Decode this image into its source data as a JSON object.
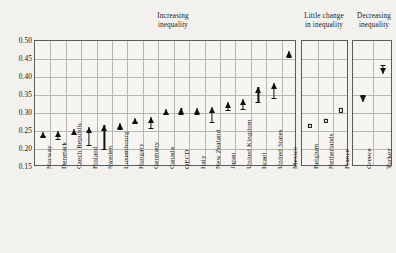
{
  "panels": {
    "increasing": {
      "title": "Increasing\ninequality"
    },
    "little": {
      "title": "Little change\nin inequality"
    },
    "decreasing": {
      "title": "Decreasing\ninequality"
    }
  },
  "axis": {
    "yticks": [
      "0.50",
      "0.45",
      "0.40",
      "0.35",
      "0.30",
      "0.25",
      "0.20",
      "0.15"
    ]
  },
  "chart_data": {
    "type": "scatter",
    "title": "Increasing inequality",
    "xlabel": "",
    "ylabel": "Gini coefficient",
    "ylim": [
      0.15,
      0.5
    ],
    "ytick_values": [
      0.5,
      0.45,
      0.4,
      0.35,
      0.3,
      0.25,
      0.2,
      0.15
    ],
    "grid": true,
    "legend": "none",
    "annotations": [
      "Increasing inequality",
      "Little change in inequality",
      "Decreasing inequality"
    ],
    "groups": [
      {
        "name": "Increasing inequality",
        "marker": "up-arrow",
        "categories": [
          "Norway",
          "Denmark",
          "Czech Republic",
          "Finland",
          "Sweden",
          "Luxembourg",
          "Hungary",
          "Germany",
          "Canada",
          "OECD",
          "Italy",
          "New Zealand",
          "Japan",
          "United Kingdom",
          "Israel",
          "United States",
          "Mexico"
        ],
        "series": [
          {
            "name": "start",
            "values": [
              0.235,
              0.228,
              0.242,
              0.212,
              0.199,
              0.256,
              0.275,
              0.258,
              0.296,
              0.298,
              0.298,
              0.275,
              0.308,
              0.31,
              0.33,
              0.343,
              0.455
            ]
          },
          {
            "name": "end",
            "values": [
              0.248,
              0.25,
              0.255,
              0.26,
              0.268,
              0.272,
              0.285,
              0.288,
              0.312,
              0.315,
              0.315,
              0.318,
              0.33,
              0.34,
              0.372,
              0.382,
              0.473
            ]
          }
        ]
      },
      {
        "name": "Little change in inequality",
        "marker": "open-square",
        "categories": [
          "Belgium",
          "Netherlands",
          "France"
        ],
        "series": [
          {
            "name": "value",
            "values": [
              0.265,
              0.277,
              0.307
            ]
          }
        ]
      },
      {
        "name": "Decreasing inequality",
        "marker": "down-arrow",
        "categories": [
          "Greece",
          "Turkey"
        ],
        "series": [
          {
            "name": "start",
            "values": [
              0.35,
              0.432
            ]
          },
          {
            "name": "end",
            "values": [
              0.33,
              0.408
            ]
          }
        ]
      }
    ]
  }
}
